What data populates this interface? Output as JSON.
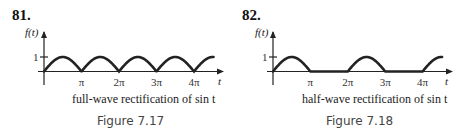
{
  "chart_data": [
    {
      "type": "line",
      "problem_number": "81.",
      "ylabel": "f(t)",
      "xlabel": "t",
      "y_ticks": [
        {
          "value": 1,
          "label": "1"
        }
      ],
      "x_ticks": [
        {
          "value": 3.14159,
          "label": "π"
        },
        {
          "value": 6.28318,
          "label": "2π"
        },
        {
          "value": 9.42478,
          "label": "3π"
        },
        {
          "value": 12.56637,
          "label": "4π"
        }
      ],
      "function": "|sin t|",
      "kind": "full",
      "xlim": [
        0,
        14.2
      ],
      "ylim": [
        0,
        1
      ],
      "caption": "full-wave rectification of sin t",
      "figure_label": "Figure 7.17"
    },
    {
      "type": "line",
      "problem_number": "82.",
      "ylabel": "f(t)",
      "xlabel": "t",
      "y_ticks": [
        {
          "value": 1,
          "label": "1"
        }
      ],
      "x_ticks": [
        {
          "value": 3.14159,
          "label": "π"
        },
        {
          "value": 6.28318,
          "label": "2π"
        },
        {
          "value": 9.42478,
          "label": "3π"
        },
        {
          "value": 12.56637,
          "label": "4π"
        }
      ],
      "function": "max(sin t, 0)",
      "kind": "half",
      "xlim": [
        0,
        14.2
      ],
      "ylim": [
        0,
        1
      ],
      "caption": "half-wave rectification of sin t",
      "figure_label": "Figure 7.18"
    }
  ]
}
